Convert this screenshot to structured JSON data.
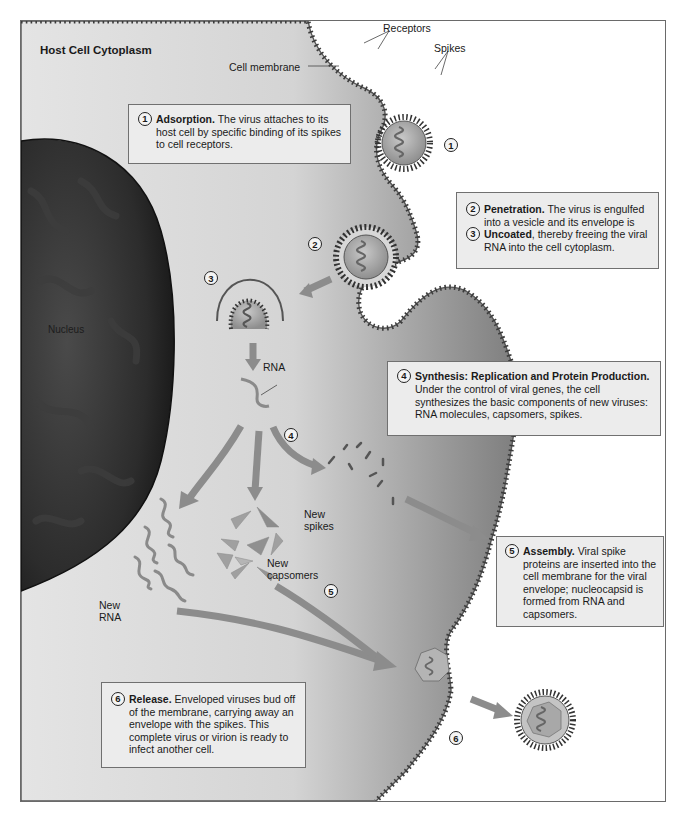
{
  "diagram": {
    "title": "Host Cell Cytoplasm",
    "labels": {
      "cell_membrane": "Cell membrane",
      "receptors": "Receptors",
      "spikes": "Spikes",
      "nucleus": "Nucleus",
      "rna": "RNA",
      "new_spikes_line1": "New",
      "new_spikes_line2": "spikes",
      "new_capsomers_line1": "New",
      "new_capsomers_line2": "capsomers",
      "new_rna_line1": "New",
      "new_rna_line2": "RNA"
    },
    "step_markers": {
      "s1": "1",
      "s2": "2",
      "s3": "3",
      "s4": "4",
      "s5": "5",
      "s6": "6"
    },
    "boxes": {
      "adsorption": {
        "num": "1",
        "heading": "Adsorption.",
        "text": " The virus attaches to its host cell by specific binding of its spikes to cell receptors."
      },
      "penetration": {
        "num": "2",
        "heading": "Penetration.",
        "text": " The virus is engulfed into a vesicle and its envelope is"
      },
      "uncoating": {
        "num": "3",
        "heading": "Uncoated",
        "text": ", thereby freeing the viral RNA into the cell cytoplasm."
      },
      "synthesis": {
        "num": "4",
        "heading": "Synthesis: Replication and Protein Production.",
        "text": "Under the control of viral genes, the cell synthesizes the basic components of new viruses: RNA molecules, capsomers, spikes."
      },
      "assembly": {
        "num": "5",
        "heading": "Assembly.",
        "text": " Viral spike proteins are inserted into the cell membrane for the viral envelope; nucleocapsid is formed from RNA and capsomers."
      },
      "release": {
        "num": "6",
        "heading": "Release.",
        "text": " Enveloped viruses bud off of the membrane, carrying away an envelope with the spikes. This complete virus or virion is ready to infect another cell."
      }
    },
    "colors": {
      "cytoplasm_light": "#e6e6e6",
      "cytoplasm_dark": "#8a8a8a",
      "nucleus": "#2e2e2e",
      "arrow": "#8c8c8c",
      "box_bg": "#ececec",
      "box_border": "#707070"
    }
  }
}
